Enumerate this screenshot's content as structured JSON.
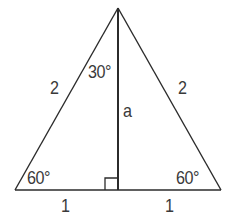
{
  "diagram": {
    "type": "equilateral-triangle-with-altitude",
    "colors": {
      "stroke": "#2b2b2b",
      "text": "#3a3a3a",
      "background": "#ffffff"
    },
    "vertices": {
      "apex": [
        118,
        8
      ],
      "base_left": [
        15,
        190
      ],
      "base_right": [
        221,
        190
      ],
      "foot": [
        118,
        190
      ]
    },
    "labels": {
      "left_side": "2",
      "right_side": "2",
      "apex_angle": "30°",
      "altitude": "a",
      "left_base_angle": "60°",
      "right_base_angle": "60°",
      "left_base_half": "1",
      "right_base_half": "1"
    },
    "right_angle_marker": true
  }
}
